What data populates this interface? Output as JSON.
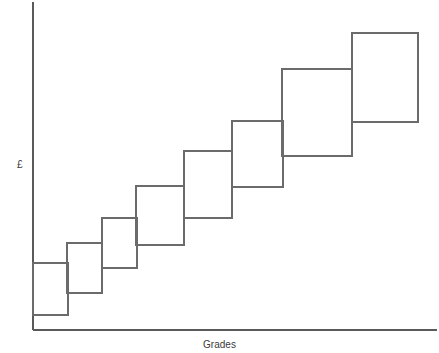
{
  "chart_data": {
    "type": "bar",
    "title": "",
    "subtitle": "",
    "xlabel": "Grades",
    "ylabel": "£",
    "categories": [
      "1",
      "2",
      "3",
      "4",
      "5",
      "6",
      "7",
      "8"
    ],
    "series": [
      {
        "name": "Pay band range",
        "low": [
          0,
          22,
          47,
          70,
          97,
          128,
          174,
          208
        ],
        "high": [
          67,
          87,
          112,
          144,
          179,
          209,
          261,
          297
        ]
      }
    ],
    "boxes": [
      {
        "label": "band-1",
        "x0": 33,
        "x1": 68,
        "top": 263,
        "bottom": 315
      },
      {
        "label": "band-2",
        "x0": 67,
        "x1": 102,
        "top": 243,
        "bottom": 293
      },
      {
        "label": "band-3",
        "x0": 102,
        "x1": 137,
        "top": 218,
        "bottom": 268
      },
      {
        "label": "band-4",
        "x0": 136,
        "x1": 184,
        "top": 186,
        "bottom": 245
      },
      {
        "label": "band-5",
        "x0": 184,
        "x1": 232,
        "top": 151,
        "bottom": 218
      },
      {
        "label": "band-6",
        "x0": 232,
        "x1": 283,
        "top": 121,
        "bottom": 187
      },
      {
        "label": "band-7",
        "x0": 282,
        "x1": 352,
        "top": 69,
        "bottom": 156
      },
      {
        "label": "band-8",
        "x0": 352,
        "x1": 418,
        "top": 33,
        "bottom": 122
      }
    ],
    "axes": {
      "y_axis": {
        "x": 33,
        "y_top": 2,
        "y_bottom": 330
      },
      "x_axis": {
        "y": 330,
        "x_left": 33,
        "x_right": 437
      },
      "ticks": [],
      "tick_labels": [],
      "grid": false,
      "legend": false
    },
    "colors": {
      "background": "#ffffff",
      "axis": "#5a5a5a",
      "box_stroke": "#6b6b6b",
      "box_fill": "none",
      "label_text": "#3b3b3b"
    }
  },
  "labels": {
    "y_axis": "£",
    "x_axis": "Grades",
    "title": ""
  }
}
